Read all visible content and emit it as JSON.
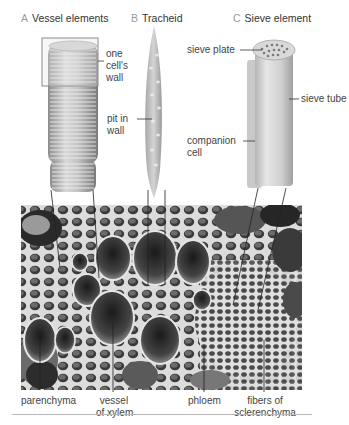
{
  "panels": [
    {
      "letter": "A",
      "title": "Vessel elements"
    },
    {
      "letter": "B",
      "title": "Tracheid"
    },
    {
      "letter": "C",
      "title": "Sieve element"
    }
  ],
  "labels": {
    "one_cells_wall": [
      "one",
      "cell's",
      "wall"
    ],
    "pit_in_wall": [
      "pit in",
      "wall"
    ],
    "sieve_plate": "sieve plate",
    "sieve_tube": "sieve tube",
    "companion_cell": [
      "companion",
      "cell"
    ]
  },
  "micrograph_labels": {
    "parenchyma": "parenchyma",
    "vessel_of_xylem": [
      "vessel",
      "of xylem"
    ],
    "phloem": "phloem",
    "fibers_of_sclerenchyma": [
      "fibers of",
      "sclerenchyma"
    ]
  },
  "colors": {
    "panel_letter": "#9a9a9a",
    "text": "#444444",
    "leader_line": "#333333",
    "rule": "#b8b8b8"
  }
}
